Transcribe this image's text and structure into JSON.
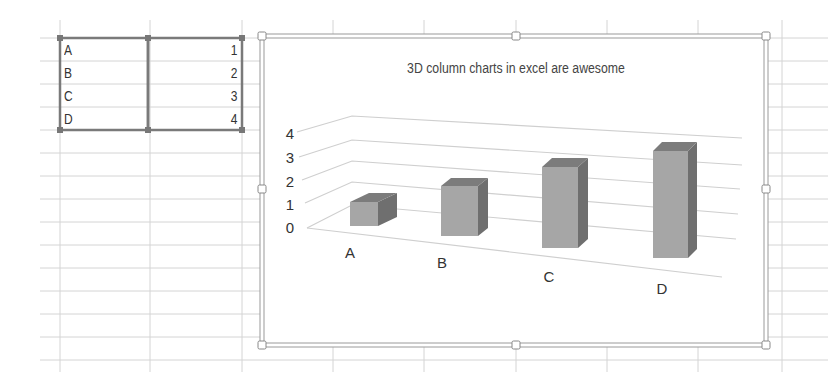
{
  "spreadsheet": {
    "grid": {
      "columns_x": [
        60,
        150,
        242,
        333,
        424,
        516,
        607,
        698,
        782
      ],
      "rows_y": [
        38,
        61,
        84,
        107,
        130,
        153,
        176,
        199,
        222,
        245,
        268,
        291,
        314,
        337,
        360
      ],
      "line_color": "#d4d4d4"
    },
    "selected_range": {
      "rows": [
        {
          "label": "A",
          "value": "1"
        },
        {
          "label": "B",
          "value": "2"
        },
        {
          "label": "C",
          "value": "3"
        },
        {
          "label": "D",
          "value": "4"
        }
      ],
      "border_color": "#7a7a7a"
    }
  },
  "chart": {
    "title": "3D column charts in excel are awesome",
    "frame_color": "#9a9a9a"
  },
  "chart_data": {
    "type": "bar",
    "variant": "3d-column",
    "title": "3D column charts in excel are awesome",
    "categories": [
      "A",
      "B",
      "C",
      "D"
    ],
    "values": [
      1,
      2,
      3,
      4
    ],
    "xlabel": "",
    "ylabel": "",
    "ylim": [
      0,
      4
    ],
    "yticks": [
      "0",
      "1",
      "2",
      "3",
      "4"
    ],
    "grid": true,
    "legend": "none",
    "bar_color": "#a6a6a6",
    "bar_side_color": "#6f6f6f",
    "bar_top_color": "#7c7c7c"
  }
}
